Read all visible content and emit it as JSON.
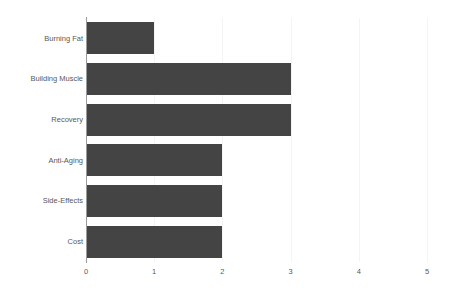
{
  "chart_data": {
    "type": "bar",
    "orientation": "horizontal",
    "title": "",
    "subtitle": "",
    "xlabel": "",
    "ylabel": "",
    "categories": [
      "Burning Fat",
      "Building Muscle",
      "Recovery",
      "Anti-Aging",
      "Side-Effects",
      "Cost"
    ],
    "values": [
      1,
      3,
      3,
      2,
      2,
      2
    ],
    "series": [
      {
        "name": "",
        "values": [
          1,
          3,
          3,
          2,
          2,
          2
        ]
      }
    ],
    "xlim": [
      0,
      5
    ],
    "xticks": [
      0,
      1,
      2,
      3,
      4,
      5
    ],
    "xtick_labels": [
      "0",
      "1",
      "2",
      "3",
      "4",
      "5"
    ],
    "grid": true,
    "grid_axis": "x",
    "legend": false,
    "legend_position": "none",
    "annotations": [],
    "bar_color": "#444444",
    "grid_color": "#f4f4f4",
    "axis_color": "#9b9b9b",
    "tick_label_color": "#595959",
    "background_color": "#ffffff"
  }
}
